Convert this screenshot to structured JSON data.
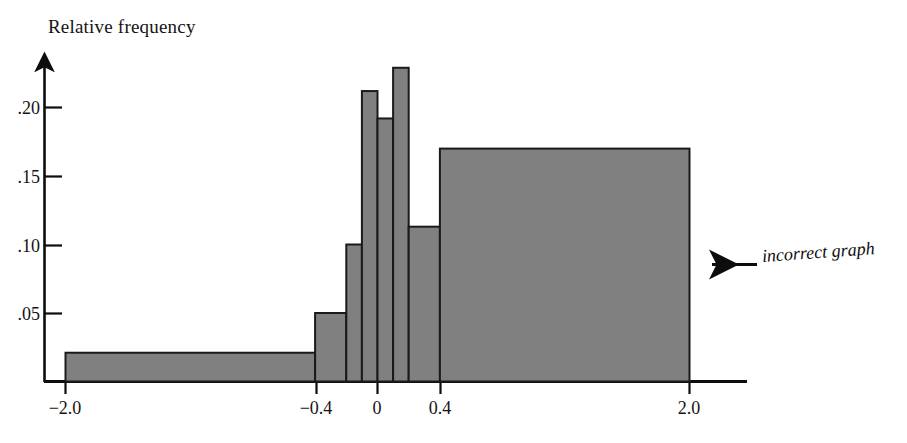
{
  "chart_data": {
    "type": "bar",
    "title": "Relative frequency",
    "subtitle": "",
    "xlabel": "",
    "ylabel": "Relative frequency",
    "grid": false,
    "legend": null,
    "xlim": [
      -2.0,
      2.0
    ],
    "ylim": [
      0,
      0.235
    ],
    "ytick_values": [
      0.05,
      0.1,
      0.15,
      0.2
    ],
    "ytick_labels": [
      ".05",
      ".10",
      ".15",
      ".20"
    ],
    "xtick_values": [
      -2.0,
      -0.4,
      0,
      0.4,
      2.0
    ],
    "xtick_labels": [
      "−2.0",
      "−0.4",
      "0",
      "0.4",
      "2.0"
    ],
    "bar_color": "#808080",
    "bar_edge_color": "#1a1a1a",
    "axis_color": "#0d0d0d",
    "bins": [
      {
        "left": -2.0,
        "right": -0.4,
        "height": 0.021
      },
      {
        "left": -0.4,
        "right": -0.2,
        "height": 0.05
      },
      {
        "left": -0.2,
        "right": -0.1,
        "height": 0.1
      },
      {
        "left": -0.1,
        "right": 0.0,
        "height": 0.212
      },
      {
        "left": 0.0,
        "right": 0.1,
        "height": 0.192
      },
      {
        "left": 0.1,
        "right": 0.2,
        "height": 0.229
      },
      {
        "left": 0.2,
        "right": 0.4,
        "height": 0.113
      },
      {
        "left": 0.4,
        "right": 2.0,
        "height": 0.17
      }
    ],
    "annotations": [
      {
        "text": "incorrect graph",
        "style": "italic",
        "arrow": "left-arrow",
        "points_to": "plot-area"
      }
    ]
  },
  "annotation": {
    "label": "incorrect graph"
  },
  "axes": {
    "title": "Relative frequency",
    "y_labels": [
      ".20",
      ".15",
      ".10",
      ".05"
    ],
    "x_labels": [
      "−2.0",
      "−0.4",
      "0",
      "0.4",
      "2.0"
    ]
  }
}
